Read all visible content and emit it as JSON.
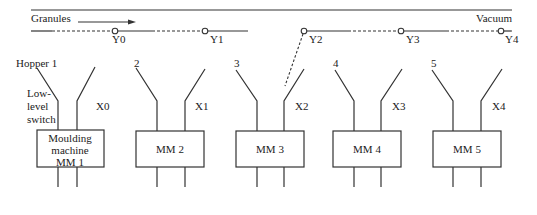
{
  "labels": {
    "granules": "Granules",
    "vacuum": "Vacuum",
    "low_level_switch": [
      "Low-",
      "level",
      "switch"
    ]
  },
  "valves": [
    {
      "id": "Y0",
      "x": 115
    },
    {
      "id": "Y1",
      "x": 205
    },
    {
      "id": "Y2",
      "x": 304
    },
    {
      "id": "Y3",
      "x": 401
    },
    {
      "id": "Y4",
      "x": 501
    }
  ],
  "machines": [
    {
      "hopper": "Hopper 1",
      "switch": "X0",
      "lines": [
        "Moulding",
        "machine",
        "MM 1"
      ]
    },
    {
      "hopper": "2",
      "switch": "X1",
      "lines": [
        "MM 2"
      ]
    },
    {
      "hopper": "3",
      "switch": "X2",
      "lines": [
        "MM 3"
      ]
    },
    {
      "hopper": "4",
      "switch": "X3",
      "lines": [
        "MM 4"
      ]
    },
    {
      "hopper": "5",
      "switch": "X4",
      "lines": [
        "MM 5"
      ]
    }
  ],
  "colors": {
    "line": "#333333",
    "text": "#222222",
    "background": "#ffffff"
  }
}
